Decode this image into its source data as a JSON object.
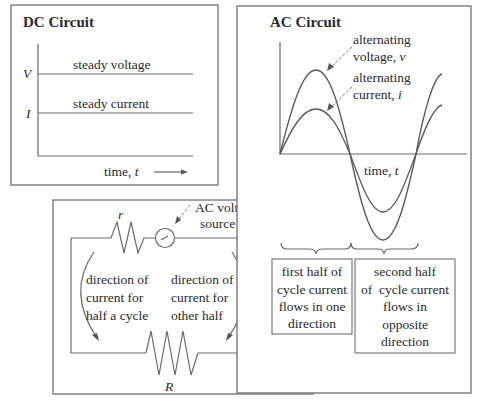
{
  "dc_panel": {
    "title": "DC Circuit",
    "y_labels": {
      "voltage": "V",
      "current": "I"
    },
    "voltage_label": "steady voltage",
    "current_label": "steady current",
    "time_label": "time, ",
    "time_var": "t"
  },
  "ac_panel": {
    "title": "AC Circuit",
    "voltage_label_line1": "alternating",
    "voltage_label_line2": "voltage, ",
    "voltage_var": "v",
    "current_label_line1": "alternating",
    "current_label_line2": "current, ",
    "current_var": "i",
    "time_label": "time, ",
    "time_var": "t",
    "first_half_box": [
      "first half of",
      "cycle current",
      "flows in one",
      "direction"
    ],
    "second_half_box": [
      "second half",
      "of  cycle current",
      "flows in",
      "opposite",
      "direction"
    ]
  },
  "circuit_panel": {
    "small_resistor_label": "r",
    "large_resistor_label": "R",
    "source_label_line1": "AC voltage",
    "source_label_line2": "source",
    "left_note": [
      "direction of",
      "current for",
      "half a cycle"
    ],
    "right_note": [
      "direction of",
      "current for",
      "other half"
    ]
  },
  "colors": {
    "stroke": "#6a6a6a",
    "text": "#2a2a2a",
    "background": "#ffffff"
  }
}
